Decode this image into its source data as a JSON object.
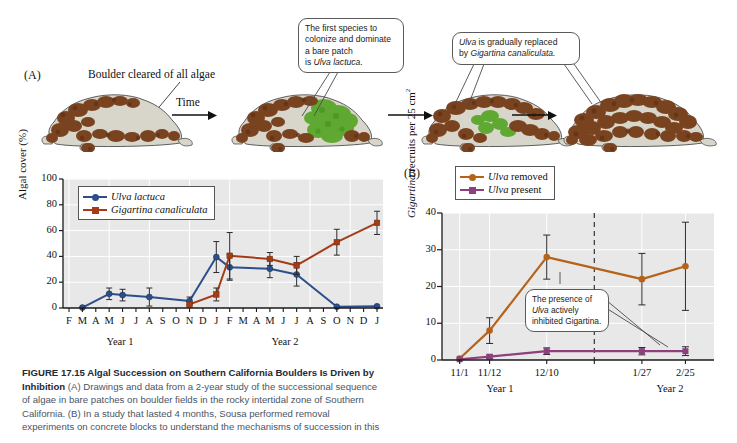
{
  "figure": {
    "panelA_label": "(A)",
    "panelB_label": "(B)",
    "boulder_label": "Boulder cleared of all algae",
    "time_label": "Time",
    "callout1": "The first species to colonize and dominate a bare patch is Ulva lactuca.",
    "callout1_lines": [
      "The first species to",
      "colonize and dominate",
      "a bare patch",
      "is "
    ],
    "callout1_italic": "Ulva lactuca.",
    "callout2_line1_pre": "",
    "callout2_italic1": "Ulva",
    "callout2_line1_post": " is gradually replaced",
    "callout2_line2_pre": "by ",
    "callout2_italic2": "Gigartina canaliculata."
  },
  "caption": {
    "figure_number": "FIGURE 17.15",
    "title": "Algal Succession on Southern California Boulders Is Driven by Inhibition",
    "body_a_tag": "(A)",
    "body_a": " Drawings and data from a 2-year study of the successional sequence of algae in bare patches on boulder fields in the rocky intertidal zone of Southern California. ",
    "body_b_tag": "(B)",
    "body_b": " In a study that lasted 4 months, Sousa performed removal experiments on concrete blocks to understand the mechanisms of succession in this"
  },
  "colors": {
    "blue": "#2c4f8c",
    "red_brown": "#a43c18",
    "orange_brown": "#b5631a",
    "purple": "#8d3f7e",
    "plot_bg": "#e8e8e8",
    "grid": "#ffffff",
    "axis": "#1a1a1a",
    "algae_brown": "#7a4320",
    "algae_green": "#5fa832",
    "rock": "#d8d5cb"
  },
  "chart_data": [
    {
      "id": "panelA-chart",
      "type": "line",
      "title": "",
      "xlabel": "",
      "ylabel": "Algal cover (%)",
      "ylim": [
        0,
        100
      ],
      "yticks": [
        0,
        20,
        40,
        60,
        80,
        100
      ],
      "xticks": [
        "F",
        "M",
        "A",
        "M",
        "J",
        "J",
        "A",
        "S",
        "O",
        "N",
        "D",
        "J",
        "F",
        "M",
        "A",
        "M",
        "J",
        "J",
        "A",
        "S",
        "O",
        "N",
        "D",
        "J"
      ],
      "xgroups": [
        {
          "label": "Year 1",
          "from": 0,
          "to": 11
        },
        {
          "label": "Year 2",
          "from": 12,
          "to": 23
        }
      ],
      "grid": true,
      "legend_position": "top-left",
      "series": [
        {
          "name": "Ulva lactuca",
          "italic": true,
          "color": "#2c4f8c",
          "marker": "circle",
          "points": [
            {
              "x": 1,
              "y": 0.3,
              "err": 0
            },
            {
              "x": 3,
              "y": 11,
              "err": 4.5
            },
            {
              "x": 4,
              "y": 10,
              "err": 4.5
            },
            {
              "x": 6,
              "y": 8.5,
              "err": 7
            },
            {
              "x": 9,
              "y": 5.5,
              "err": 3
            },
            {
              "x": 11,
              "y": 39.5,
              "err": 12
            },
            {
              "x": 12,
              "y": 31.5,
              "err": 10
            },
            {
              "x": 15,
              "y": 30.5,
              "err": 7
            },
            {
              "x": 17,
              "y": 26,
              "err": 9
            },
            {
              "x": 20,
              "y": 1,
              "err": 0
            },
            {
              "x": 23,
              "y": 1.3,
              "err": 0
            }
          ]
        },
        {
          "name": "Gigartina canaliculata",
          "italic": true,
          "color": "#a43c18",
          "marker": "square",
          "points": [
            {
              "x": 9,
              "y": 2.8,
              "err": 0
            },
            {
              "x": 11,
              "y": 10.5,
              "err": 5
            },
            {
              "x": 12,
              "y": 40.5,
              "err": 18
            },
            {
              "x": 15,
              "y": 38,
              "err": 5
            },
            {
              "x": 17,
              "y": 33,
              "err": 7
            },
            {
              "x": 20,
              "y": 51,
              "err": 10
            },
            {
              "x": 23,
              "y": 66,
              "err": 9
            }
          ]
        }
      ]
    },
    {
      "id": "panelB-chart",
      "type": "line",
      "title": "",
      "xlabel": "",
      "ylabel": "Gigartina recruits per 25 cm2",
      "ylim": [
        0,
        40
      ],
      "yticks": [
        0,
        10,
        20,
        30,
        40
      ],
      "xticks": [
        "11/1",
        "11/12",
        "12/10",
        "1/27",
        "2/25"
      ],
      "xgroups": [
        {
          "label": "Year 1",
          "from": 0,
          "to": 2
        },
        {
          "label": "Year 2",
          "from": 3,
          "to": 4
        }
      ],
      "divider_after": 2,
      "grid": true,
      "legend_position": "above",
      "annotation": {
        "line1": "The presence of",
        "line2_italic": "Ulva",
        "line2_rest": " actively",
        "line3": "inhibited Gigartina."
      },
      "series": [
        {
          "name": "Ulva removed",
          "italic_first_word": true,
          "color": "#b5631a",
          "marker": "circle",
          "points": [
            {
              "x": 0,
              "y": 0.4,
              "err": 0
            },
            {
              "x": 1,
              "y": 8,
              "err": 3.5
            },
            {
              "x": 2,
              "y": 28,
              "err": 6
            },
            {
              "x": 3,
              "y": 22,
              "err": 7
            },
            {
              "x": 4,
              "y": 25.5,
              "err": 12
            }
          ]
        },
        {
          "name": "Ulva present",
          "italic_first_word": true,
          "color": "#8d3f7e",
          "marker": "square",
          "points": [
            {
              "x": 0,
              "y": 0.2,
              "err": 0
            },
            {
              "x": 1,
              "y": 0.9,
              "err": 0.5
            },
            {
              "x": 2,
              "y": 2.4,
              "err": 0.9
            },
            {
              "x": 3,
              "y": 2.4,
              "err": 1.0
            },
            {
              "x": 4,
              "y": 2.4,
              "err": 1.2
            }
          ]
        }
      ]
    }
  ]
}
